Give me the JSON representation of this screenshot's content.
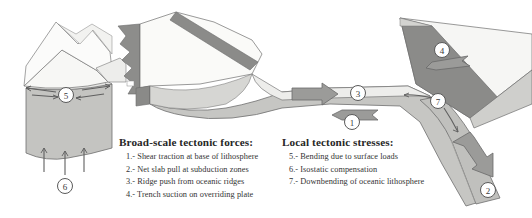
{
  "figure": {
    "background": "#ffffff"
  },
  "colors": {
    "crust_light": "#f2f2f0",
    "crust_shadow": "#d9d9d7",
    "mantle_light": "#c9c9c7",
    "mantle_mid": "#b9b9b6",
    "slab_dark": "#8e8e8c",
    "arrow_fill": "#9a9a98",
    "outline": "#6b6b6b",
    "text": "#2b2b2b"
  },
  "legends": {
    "forces": {
      "title": "Broad-scale tectonic forces:",
      "items": [
        "1.- Shear traction at base of lithosphere",
        "2.- Net slab pull at subduction zones",
        "3.- Ridge push from oceanic ridges",
        "4.- Trench suction on overriding plate"
      ]
    },
    "stresses": {
      "title": "Local tectonic stresses:",
      "items": [
        "5.- Bending due to surface loads",
        "6.- Isostatic compensation",
        "7.- Downbending of oceanic lithosphere"
      ]
    }
  },
  "callouts": [
    {
      "id": "callout-1",
      "label": "1",
      "x": 352,
      "y": 122
    },
    {
      "id": "callout-2",
      "label": "2",
      "x": 488,
      "y": 190
    },
    {
      "id": "callout-3",
      "label": "3",
      "x": 358,
      "y": 93
    },
    {
      "id": "callout-4",
      "label": "4",
      "x": 442,
      "y": 50
    },
    {
      "id": "callout-5",
      "label": "5",
      "x": 66,
      "y": 95
    },
    {
      "id": "callout-6",
      "label": "6",
      "x": 65,
      "y": 186
    },
    {
      "id": "callout-7",
      "label": "7",
      "x": 438,
      "y": 101
    }
  ],
  "features": {
    "mountain_range": "mountain-range-left",
    "ridge": "mid-ocean-ridge",
    "oceanic_plate": "oceanic-plate",
    "subducting_slab": "subducting-slab",
    "overriding_plate": "overriding-plate",
    "isostatic_arrows": "isostatic-compensation-arrows",
    "bending_arrows": "surface-load-bending-arrows",
    "ridge_push_arrow": "ridge-push-arrow",
    "shear_traction_arrow": "shear-traction-arrow",
    "trench_suction_arrow": "trench-suction-arrow",
    "slab_pull_arrow": "slab-pull-arrow",
    "downbending_arrow": "downbending-arrow"
  }
}
